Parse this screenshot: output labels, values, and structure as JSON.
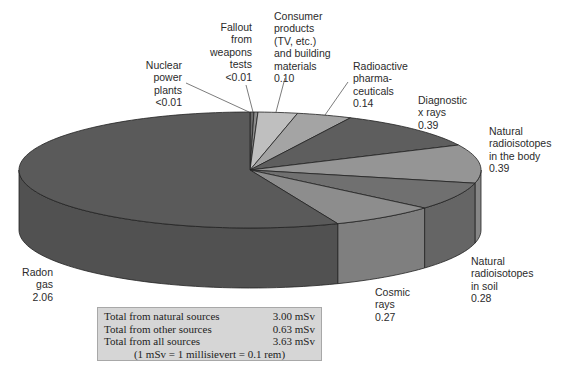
{
  "chart_data": {
    "type": "pie",
    "style": "3d-exploded-free (tilted 3D pie)",
    "title": "",
    "unit": "mSv",
    "total": 3.63,
    "slices": [
      {
        "key": "nuclear",
        "label": "Nuclear\npower\nplants",
        "value_text": "<0.01",
        "value": 0.01,
        "color": "#6a6a6a"
      },
      {
        "key": "fallout",
        "label": "Fallout\nfrom\nweapons\ntests",
        "value_text": "<0.01",
        "value": 0.01,
        "color": "#8c8c8c"
      },
      {
        "key": "consumer",
        "label": "Consumer\nproducts\n(TV, etc.)\nand building\nmaterials",
        "value_text": "0.10",
        "value": 0.1,
        "color": "#bfbfbf"
      },
      {
        "key": "pharma",
        "label": "Radioactive\npharma-\nceuticals",
        "value_text": "0.14",
        "value": 0.14,
        "color": "#a4a4a4"
      },
      {
        "key": "diag",
        "label": "Diagnostic\nx rays",
        "value_text": "0.39",
        "value": 0.39,
        "color": "#5e5e5e"
      },
      {
        "key": "body",
        "label": "Natural\nradioisotopes\nin the body",
        "value_text": "0.39",
        "value": 0.39,
        "color": "#959595"
      },
      {
        "key": "soil",
        "label": "Natural\nradioisotopes\nin soil",
        "value_text": "0.28",
        "value": 0.28,
        "color": "#707070"
      },
      {
        "key": "cosmic",
        "label": "Cosmic\nrays",
        "value_text": "0.27",
        "value": 0.27,
        "color": "#8d8d8d"
      },
      {
        "key": "radon",
        "label": "Radon\ngas",
        "value_text": "2.06",
        "value": 2.06,
        "color": "#5a5a5a"
      }
    ],
    "summary": [
      {
        "label": "Total from natural sources",
        "value": "3.00 mSv"
      },
      {
        "label": "Total from other sources",
        "value": "0.63 mSv"
      },
      {
        "label": "Total from all sources",
        "value": "3.63 mSv"
      }
    ],
    "note": "(1 mSv = 1 millisievert = 0.1 rem)"
  },
  "labels": {
    "nuclear": {
      "text": "Nuclear\npower\nplants\n<0.01"
    },
    "fallout": {
      "text": "Fallout\nfrom\nweapons\ntests\n<0.01"
    },
    "consumer": {
      "text": "Consumer\nproducts\n(TV, etc.)\nand building\nmaterials\n0.10"
    },
    "pharma": {
      "text": "Radioactive\npharma-\nceuticals\n0.14"
    },
    "diag": {
      "text": "Diagnostic\nx rays\n0.39"
    },
    "body": {
      "text": "Natural\nradioisotopes\nin the body\n0.39"
    },
    "soil": {
      "text": "Natural\nradioisotopes\nin soil\n0.28"
    },
    "cosmic": {
      "text": "Cosmic\nrays\n0.27"
    },
    "radon": {
      "text": "Radon\ngas\n2.06"
    }
  },
  "summary_box": {
    "rows": [
      {
        "label": "Total from natural sources",
        "value": "3.00 mSv"
      },
      {
        "label": "Total from other sources",
        "value": "0.63 mSv"
      },
      {
        "label": "Total from all sources",
        "value": "3.63 mSv"
      }
    ],
    "note": "(1 mSv = 1 millisievert = 0.1 rem)"
  }
}
